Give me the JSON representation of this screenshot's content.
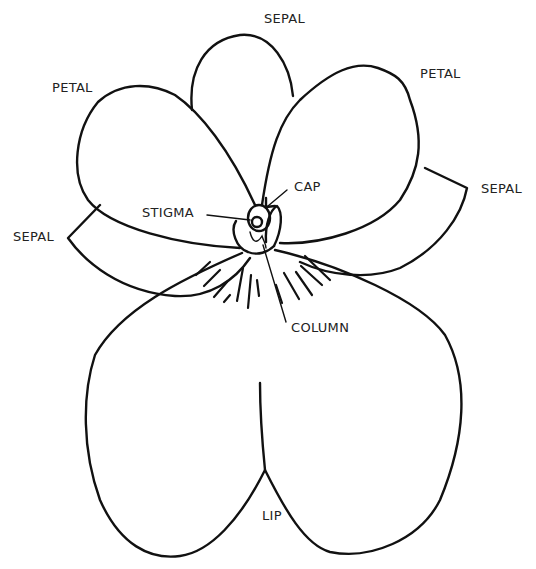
{
  "diagram": {
    "labels": {
      "sepal_top": "SEPAL",
      "petal_left": "PETAL",
      "petal_right": "PETAL",
      "sepal_right": "SEPAL",
      "sepal_left": "SEPAL",
      "cap": "CAP",
      "stigma": "STIGMA",
      "column": "COLUMN",
      "lip": "LIP"
    },
    "colors": {
      "line": "#111111",
      "background": "#ffffff",
      "text": "#222222"
    }
  }
}
